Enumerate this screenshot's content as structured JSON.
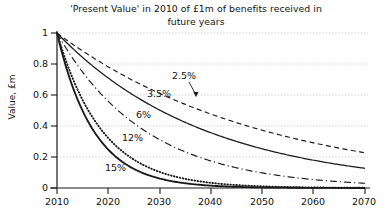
{
  "chart_data": {
    "type": "line",
    "title": "'Present Value' in 2010 of £1m of benefits received in future years",
    "title_lines": [
      "'Present Value' in 2010 of £1m of benefits received in",
      "future years"
    ],
    "xlabel": "",
    "ylabel": "Value, £m",
    "xlim": [
      2010,
      2070
    ],
    "ylim": [
      0,
      1
    ],
    "xticks": [
      2010,
      2020,
      2030,
      2040,
      2050,
      2060,
      2070
    ],
    "xtick_labels": [
      "2010",
      "2020",
      "2030",
      "2040",
      "2050",
      "2060",
      "2070"
    ],
    "yticks": [
      0,
      0.2,
      0.4,
      0.6,
      0.8,
      1
    ],
    "ytick_labels": [
      "0",
      "0.2",
      "0.4",
      "0.6",
      "0.8",
      "1"
    ],
    "grid": "horizontal-dotted",
    "legend": "inline-annotations",
    "x": [
      2010,
      2015,
      2020,
      2025,
      2030,
      2035,
      2040,
      2045,
      2050,
      2055,
      2060,
      2065,
      2070
    ],
    "series": [
      {
        "name": "2.5%",
        "rate": 0.025,
        "style": "dashed",
        "label": "2.5%",
        "annotation_arrow": true,
        "values": [
          1.0,
          0.883,
          0.781,
          0.69,
          0.61,
          0.539,
          0.476,
          0.421,
          0.372,
          0.329,
          0.29,
          0.257,
          0.227
        ]
      },
      {
        "name": "3.5%",
        "rate": 0.035,
        "style": "solid",
        "label": "3.5%",
        "annotation_arrow": false,
        "values": [
          1.0,
          0.842,
          0.709,
          0.597,
          0.503,
          0.423,
          0.356,
          0.3,
          0.253,
          0.213,
          0.179,
          0.151,
          0.127
        ]
      },
      {
        "name": "6%",
        "rate": 0.06,
        "style": "dash-dot",
        "label": "6%",
        "annotation_arrow": false,
        "values": [
          1.0,
          0.747,
          0.558,
          0.417,
          0.312,
          0.233,
          0.174,
          0.13,
          0.097,
          0.073,
          0.054,
          0.04,
          0.03
        ]
      },
      {
        "name": "12%",
        "rate": 0.12,
        "style": "dotted",
        "label": "12%",
        "annotation_arrow": false,
        "values": [
          1.0,
          0.567,
          0.322,
          0.183,
          0.104,
          0.059,
          0.033,
          0.019,
          0.011,
          0.006,
          0.003,
          0.002,
          0.001
        ]
      },
      {
        "name": "15%",
        "rate": 0.15,
        "style": "solid-thick",
        "label": "15%",
        "annotation_arrow": false,
        "values": [
          1.0,
          0.497,
          0.247,
          0.123,
          0.061,
          0.03,
          0.015,
          0.0075,
          0.0037,
          0.0018,
          0.0009,
          0.00045,
          0.00022
        ]
      }
    ],
    "colors": {
      "line": "#1a1a1a",
      "grid": "#b9b9b9",
      "axis": "#1a1a1a",
      "background": "#ffffff"
    }
  }
}
